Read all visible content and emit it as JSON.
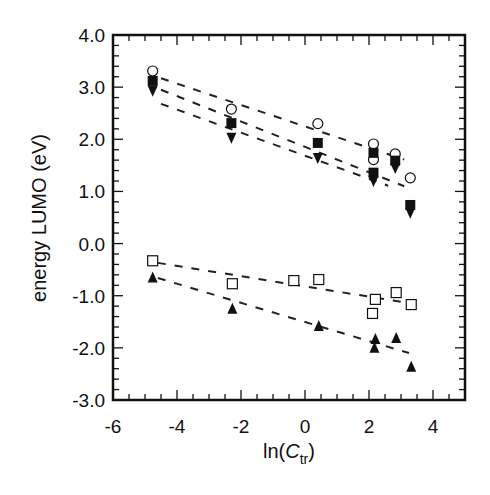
{
  "chart_data": {
    "type": "scatter",
    "title": "",
    "xlabel": "ln(C_tr)",
    "xlabel_parts": {
      "prefix": "ln(",
      "italic": "C",
      "subscript": "tr",
      "suffix": ")"
    },
    "ylabel": "energy LUMO (eV)",
    "xlim": [
      -6,
      5
    ],
    "ylim": [
      -3.0,
      4.0
    ],
    "x_ticks": [
      -6,
      -4,
      -2,
      0,
      2,
      4
    ],
    "x_tick_labels": [
      "-6",
      "-4",
      "-2",
      "0",
      "2",
      "4"
    ],
    "y_ticks": [
      4.0,
      3.0,
      2.0,
      1.0,
      0.0,
      -1.0,
      -2.0,
      -3.0
    ],
    "y_tick_labels": [
      "4.0",
      "3.0",
      "2.0",
      "1.0",
      "0.0",
      "-1.0",
      "-2.0",
      "-3.0"
    ],
    "grid": false,
    "legend": null,
    "series": [
      {
        "name": "open circles",
        "marker": "circle-open",
        "points": [
          [
            -4.76,
            3.31
          ],
          [
            -2.3,
            2.58
          ],
          [
            0.4,
            2.3
          ],
          [
            2.14,
            1.91
          ],
          [
            2.14,
            1.61
          ],
          [
            2.82,
            1.72
          ],
          [
            3.29,
            1.26
          ]
        ],
        "fit": {
          "x": [
            -4.5,
            3.1
          ],
          "y": [
            3.17,
            1.61
          ]
        }
      },
      {
        "name": "filled squares",
        "marker": "square-filled",
        "points": [
          [
            -4.76,
            3.12
          ],
          [
            -2.3,
            2.31
          ],
          [
            0.4,
            1.93
          ],
          [
            2.14,
            1.74
          ],
          [
            2.14,
            1.36
          ],
          [
            2.82,
            1.59
          ],
          [
            3.29,
            0.74
          ]
        ],
        "fit": {
          "x": [
            -4.5,
            3.1
          ],
          "y": [
            2.95,
            1.1
          ]
        }
      },
      {
        "name": "filled down-triangles",
        "marker": "triangle-down-filled",
        "points": [
          [
            -4.76,
            2.93
          ],
          [
            -2.3,
            2.03
          ],
          [
            0.4,
            1.64
          ],
          [
            2.14,
            1.2
          ],
          [
            2.82,
            1.45
          ],
          [
            3.29,
            0.59
          ]
        ],
        "fit": {
          "x": [
            -4.5,
            2.6
          ],
          "y": [
            2.68,
            1.11
          ]
        }
      },
      {
        "name": "open squares",
        "marker": "square-open",
        "points": [
          [
            -4.76,
            -0.33
          ],
          [
            -2.27,
            -0.77
          ],
          [
            -0.35,
            -0.71
          ],
          [
            0.43,
            -0.69
          ],
          [
            2.2,
            -1.07
          ],
          [
            2.11,
            -1.34
          ],
          [
            2.85,
            -0.94
          ],
          [
            3.32,
            -1.17
          ]
        ],
        "fit": {
          "x": [
            -4.6,
            3.25
          ],
          "y": [
            -0.37,
            -1.14
          ]
        }
      },
      {
        "name": "filled up-triangles",
        "marker": "triangle-up-filled",
        "points": [
          [
            -4.76,
            -0.65
          ],
          [
            -2.27,
            -1.25
          ],
          [
            0.43,
            -1.58
          ],
          [
            2.2,
            -1.83
          ],
          [
            2.17,
            -2.0
          ],
          [
            2.85,
            -1.81
          ],
          [
            3.32,
            -2.36
          ]
        ],
        "fit": {
          "x": [
            -4.6,
            3.25
          ],
          "y": [
            -0.66,
            -2.1
          ]
        }
      }
    ]
  }
}
